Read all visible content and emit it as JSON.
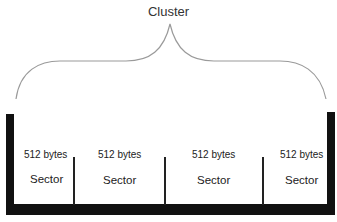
{
  "diagram": {
    "title": "Cluster",
    "sectors": [
      {
        "size": "512 bytes",
        "label": "Sector"
      },
      {
        "size": "512 bytes",
        "label": "Sector"
      },
      {
        "size": "512 bytes",
        "label": "Sector"
      },
      {
        "size": "512 bytes",
        "label": "Sector"
      }
    ],
    "colors": {
      "structure": "#111111",
      "brace": "#999999",
      "text": "#222222"
    }
  }
}
